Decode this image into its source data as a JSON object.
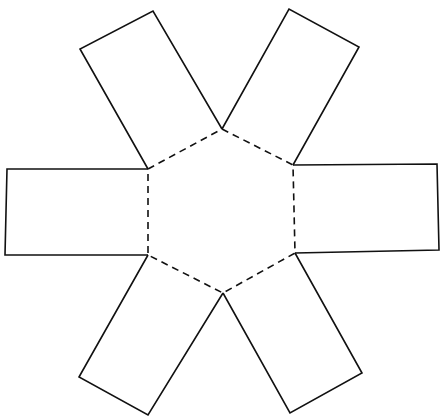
{
  "diagram": {
    "type": "net",
    "colors": {
      "line": "#111111",
      "background": "#ffffff"
    },
    "hexagon": {
      "style": "dashed",
      "points": "222,129 293,165 295,253 223,293 148,255 148,169"
    },
    "faces": [
      {
        "id": "upper-left",
        "points": "148,169 80,49 153,11 222,129"
      },
      {
        "id": "upper-right",
        "points": "222,129 289,9 359,47 293,165"
      },
      {
        "id": "right",
        "points": "293,165 437,164 439,250 295,253"
      },
      {
        "id": "lower-right",
        "points": "295,253 362,373 290,413 223,293"
      },
      {
        "id": "lower-left",
        "points": "223,293 148,415 79,377 148,255"
      },
      {
        "id": "left",
        "points": "148,255 5,255 7,169 148,169"
      }
    ]
  }
}
